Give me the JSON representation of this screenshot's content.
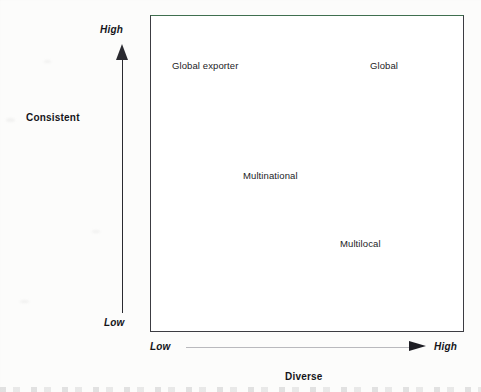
{
  "diagram": {
    "type": "2x2-matrix",
    "y_axis": {
      "title": "Consistent",
      "low_label": "Low",
      "high_label": "High",
      "direction": "upward",
      "arrow_color": "#2a2a30"
    },
    "x_axis": {
      "title": "Diverse",
      "low_label": "Low",
      "high_label": "High",
      "direction": "rightward",
      "arrow_color": "#1e1e24"
    },
    "box": {
      "border_color": "#3c3c42",
      "top_border_color": "#3f6f4f",
      "fill_color": "#ffffff"
    },
    "cells": [
      {
        "label": "Global exporter",
        "quadrant": "top-left"
      },
      {
        "label": "Global",
        "quadrant": "top-right"
      },
      {
        "label": "Multinational",
        "quadrant": "center"
      },
      {
        "label": "Multilocal",
        "quadrant": "lower-right"
      }
    ]
  }
}
